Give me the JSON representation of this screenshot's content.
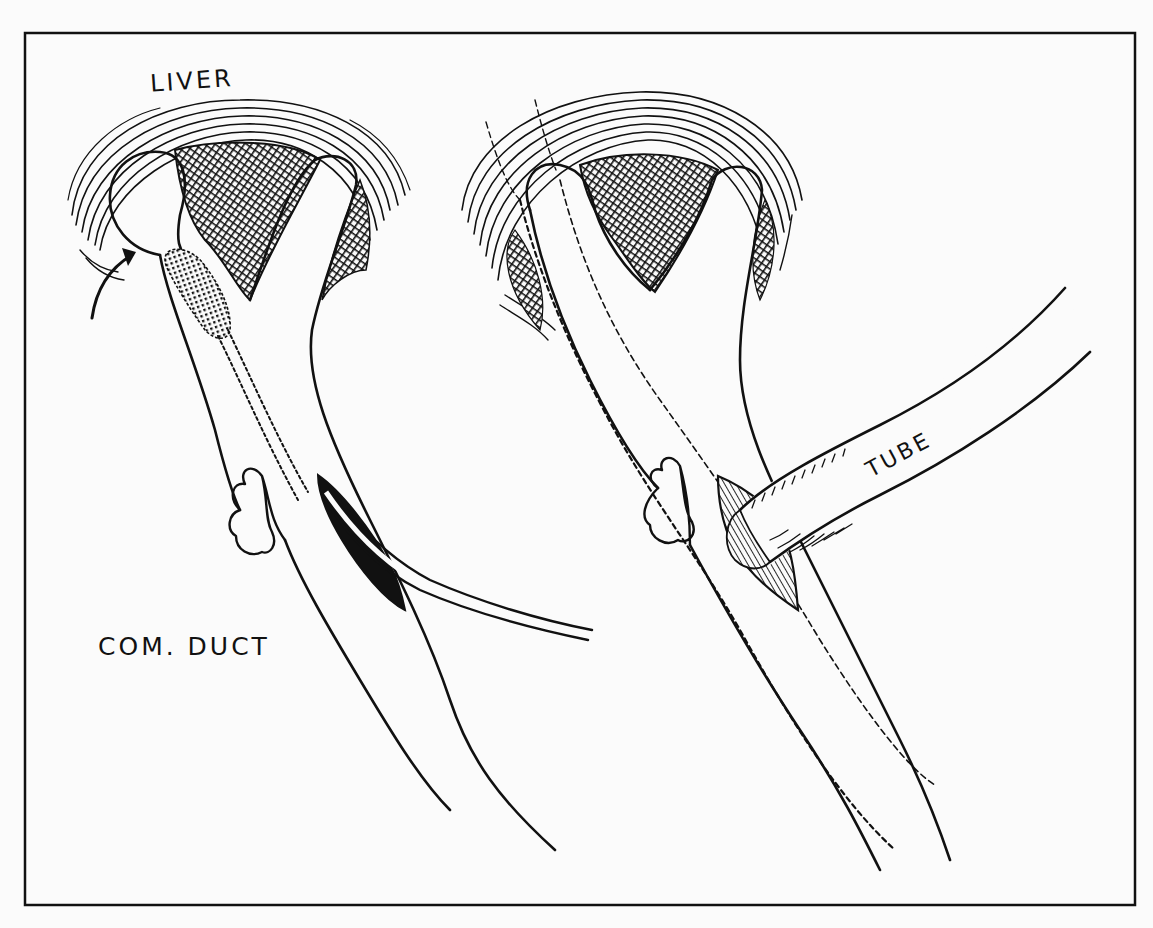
{
  "figure": {
    "type": "surgical-illustration",
    "colors": {
      "ink": "#111111",
      "paper": "#fbfbfb"
    }
  },
  "labels": {
    "liver": "LIVER",
    "common_duct": "COM. DUCT",
    "tube": "TUBE"
  },
  "panels": [
    {
      "name": "left",
      "shows": [
        "liver",
        "hepatic-duct-bifurcation",
        "dilator-in-duct",
        "arrow",
        "duct-incision",
        "probe-catheter",
        "cystic-duct-stump"
      ]
    },
    {
      "name": "right",
      "shows": [
        "liver",
        "hepatic-duct-bifurcation",
        "dashed-guide-lines",
        "cystic-duct-stump",
        "inserted-tube"
      ]
    }
  ]
}
